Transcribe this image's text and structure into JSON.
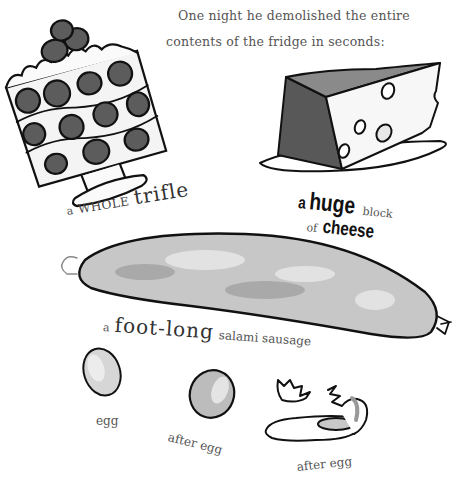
{
  "page": {
    "intro_line_1": "One night he demolished the entire",
    "intro_line_2": "contents of the fridge in seconds:"
  },
  "items": {
    "trifle": {
      "prefix": "a",
      "caps": "WHOLE",
      "main": "trifle",
      "icon": "trifle-icon"
    },
    "cheese": {
      "prefix": "a",
      "bold": "huge",
      "suffix": "block",
      "line2_prefix": "of",
      "line2_bold": "cheese",
      "icon": "cheese-icon"
    },
    "salami": {
      "prefix": "a",
      "big": "foot-long",
      "suffix": "salami sausage",
      "icon": "salami-icon"
    },
    "egg_1": {
      "label": "egg",
      "icon": "egg-icon"
    },
    "egg_2": {
      "label": "after egg",
      "icon": "egg-icon"
    },
    "egg_3": {
      "label": "after egg",
      "icon": "cracked-egg-icon"
    }
  },
  "colors": {
    "ink": "#111111",
    "text": "#444444",
    "shade_dark": "#5a5a5a",
    "shade_light": "#bdbdbd"
  }
}
